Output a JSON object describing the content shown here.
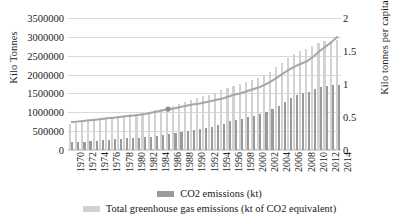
{
  "chart_data": {
    "type": "bar",
    "title": "",
    "xlabel": "",
    "ylabel": "Kilo Tonnes",
    "y2label": "Kilo tonnes per capita",
    "ylim": [
      0,
      3500000
    ],
    "y2lim": [
      0,
      2
    ],
    "yticks": [
      "0",
      "500000",
      "1000000",
      "1500000",
      "2000000",
      "2500000",
      "3000000",
      "3500000"
    ],
    "y2ticks": [
      "0",
      "0.5",
      "1",
      "1.5",
      "2"
    ],
    "grid": true,
    "legend_position": "bottom",
    "categories": [
      1970,
      1971,
      1972,
      1973,
      1974,
      1975,
      1976,
      1977,
      1978,
      1979,
      1980,
      1981,
      1982,
      1983,
      1984,
      1985,
      1986,
      1987,
      1988,
      1989,
      1990,
      1991,
      1992,
      1993,
      1994,
      1995,
      1996,
      1997,
      1998,
      1999,
      2000,
      2001,
      2002,
      2003,
      2004,
      2005,
      2006,
      2007,
      2008,
      2009,
      2010,
      2011,
      2012,
      2013,
      2014
    ],
    "tick_labels": [
      "1970",
      "1972",
      "1974",
      "1976",
      "1978",
      "1980",
      "1982",
      "1984",
      "1986",
      "1988",
      "1990",
      "1992",
      "1994",
      "1996",
      "1998",
      "2000",
      "2002",
      "2004",
      "2006",
      "2008",
      "2010",
      "2012",
      "2014"
    ],
    "series": [
      {
        "name": "CO2 emissions (kt)",
        "color": "#9a9a9a",
        "axis": "left",
        "values": [
          200000,
          210000,
          225000,
          245000,
          250000,
          255000,
          275000,
          290000,
          305000,
          325000,
          330000,
          330000,
          340000,
          355000,
          380000,
          400000,
          420000,
          450000,
          480000,
          510000,
          540000,
          560000,
          590000,
          620000,
          660000,
          700000,
          760000,
          800000,
          830000,
          870000,
          900000,
          950000,
          1000000,
          1080000,
          1180000,
          1280000,
          1380000,
          1450000,
          1500000,
          1550000,
          1620000,
          1680000,
          1700000,
          1720000,
          1730000
        ]
      },
      {
        "name": "Total greenhouse gas emissions (kt of CO2 equivalent)",
        "color": "#d2d2d2",
        "axis": "left",
        "values": [
          700000,
          720000,
          740000,
          770000,
          790000,
          810000,
          840000,
          870000,
          900000,
          930000,
          950000,
          960000,
          980000,
          1010000,
          1050000,
          1090000,
          1130000,
          1180000,
          1230000,
          1280000,
          1330000,
          1370000,
          1420000,
          1470000,
          1520000,
          1580000,
          1650000,
          1700000,
          1750000,
          1800000,
          1850000,
          1920000,
          1990000,
          2080000,
          2200000,
          2320000,
          2450000,
          2550000,
          2620000,
          2680000,
          2760000,
          2840000,
          2880000,
          2900000,
          2930000
        ]
      },
      {
        "name": "per-capita-line",
        "color": "#a6a6a6",
        "axis": "right",
        "values": [
          0.42,
          0.43,
          0.44,
          0.45,
          0.46,
          0.47,
          0.48,
          0.49,
          0.5,
          0.51,
          0.52,
          0.53,
          0.54,
          0.56,
          0.58,
          0.6,
          0.62,
          0.63,
          0.65,
          0.67,
          0.69,
          0.7,
          0.72,
          0.74,
          0.76,
          0.78,
          0.81,
          0.84,
          0.86,
          0.89,
          0.92,
          0.95,
          0.99,
          1.04,
          1.1,
          1.16,
          1.22,
          1.27,
          1.31,
          1.35,
          1.42,
          1.5,
          1.57,
          1.64,
          1.72
        ]
      }
    ],
    "marker": {
      "x": 1986,
      "y": 0.62
    }
  }
}
